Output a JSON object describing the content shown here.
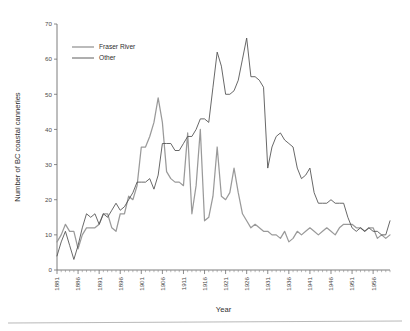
{
  "chart_data": {
    "type": "line",
    "title": "",
    "xlabel": "Year",
    "ylabel": "Number of BC coastal canneries",
    "xlim": [
      1881,
      1960
    ],
    "ylim": [
      0,
      70
    ],
    "yticks": [
      0,
      10,
      20,
      30,
      40,
      50,
      60,
      70
    ],
    "xticks": [
      1881,
      1886,
      1891,
      1896,
      1901,
      1906,
      1911,
      1916,
      1921,
      1926,
      1931,
      1936,
      1941,
      1946,
      1951,
      1956
    ],
    "minor_tick_interval": 1,
    "grid": false,
    "legend_position": "top-left",
    "x": [
      1881,
      1882,
      1883,
      1884,
      1885,
      1886,
      1887,
      1888,
      1889,
      1890,
      1891,
      1892,
      1893,
      1894,
      1895,
      1896,
      1897,
      1898,
      1899,
      1900,
      1901,
      1902,
      1903,
      1904,
      1905,
      1906,
      1907,
      1908,
      1909,
      1910,
      1911,
      1912,
      1913,
      1914,
      1915,
      1916,
      1917,
      1918,
      1919,
      1920,
      1921,
      1922,
      1923,
      1924,
      1925,
      1926,
      1927,
      1928,
      1929,
      1930,
      1931,
      1932,
      1933,
      1934,
      1935,
      1936,
      1937,
      1938,
      1939,
      1940,
      1941,
      1942,
      1943,
      1944,
      1945,
      1946,
      1947,
      1948,
      1949,
      1950,
      1951,
      1952,
      1953,
      1954,
      1955,
      1956,
      1957,
      1958,
      1959,
      1960
    ],
    "series": [
      {
        "name": "Fraser River",
        "color": "#9a9a9a",
        "values": [
          8,
          10,
          13,
          11,
          11,
          6,
          10,
          12,
          12,
          12,
          13,
          16,
          16,
          12,
          11,
          16,
          16,
          21,
          20,
          24,
          35,
          35,
          38,
          42,
          49,
          42,
          28,
          26,
          25,
          25,
          24,
          39,
          16,
          24,
          40,
          14,
          15,
          21,
          35,
          21,
          20,
          22,
          29,
          22,
          16,
          14,
          12,
          13,
          12,
          11,
          11,
          10,
          10,
          9,
          11,
          8,
          9,
          11,
          10,
          11,
          12,
          11,
          10,
          11,
          12,
          11,
          10,
          12,
          13,
          13,
          13,
          12,
          12,
          11,
          12,
          12,
          9,
          10,
          9,
          10
        ]
      },
      {
        "name": "Other",
        "color": "#4d4d4d",
        "values": [
          4,
          8,
          11,
          7,
          3,
          7,
          12,
          16,
          15,
          16,
          13,
          16,
          15,
          17,
          19,
          17,
          18,
          20,
          22,
          25,
          25,
          25,
          26,
          23,
          27,
          36,
          36,
          36,
          34,
          34,
          36,
          38,
          38,
          40,
          43,
          43,
          42,
          52,
          62,
          58,
          50,
          50,
          51,
          54,
          60,
          66,
          55,
          55,
          54,
          52,
          29,
          35,
          38,
          39,
          37,
          36,
          35,
          29,
          26,
          27,
          29,
          22,
          19,
          19,
          19,
          20,
          19,
          19,
          19,
          15,
          12,
          11,
          12,
          11,
          12,
          11,
          11,
          10,
          10,
          14
        ]
      }
    ]
  },
  "legend": {
    "items": [
      {
        "label": "Fraser River"
      },
      {
        "label": "Other"
      }
    ]
  },
  "axes": {
    "y_title": "Number of BC coastal canneries",
    "x_title": "Year"
  }
}
